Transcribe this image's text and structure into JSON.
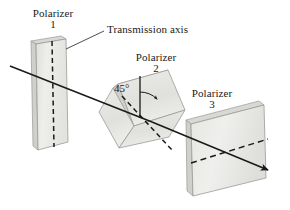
{
  "figure": {
    "background_color": "#ffffff",
    "width": 290,
    "height": 210
  },
  "labels": {
    "polarizer1_name": "Polarizer",
    "polarizer1_number": "1",
    "polarizer2_name": "Polarizer",
    "polarizer2_number": "2",
    "polarizer3_name": "Polarizer",
    "polarizer3_number": "3",
    "transmission_axis": "Transmission axis",
    "angle": "45°"
  },
  "colors": {
    "slab_fill": "#e9e9e6",
    "slab_fill_light": "#f3f3f1",
    "slab_edge": "#9a9a96",
    "slab_side": "#d2d2ce",
    "ray": "#1a1a1a",
    "axis_dash": "#1a1a1a",
    "text": "#1a1a1a",
    "leader": "#3a3a3a"
  },
  "geometry": {
    "slab1": {
      "label": "polarizer-1-slab",
      "face": "36,44 66,39 68,142 38,150",
      "side": "36,44 38,150 33,146 31,41",
      "top": "31,41 61,36 66,39 36,44",
      "axis_dash": "52,41 54,146",
      "orientation": "vertical transmission axis"
    },
    "slab2": {
      "label": "polarizer-2-slab",
      "face": "118,84 168,70 185,110 134,126",
      "side": "118,84 134,126 128,131 113,88",
      "top": "113,88 163,74 168,70 118,84",
      "axis_dash": "125,100 175,152",
      "orientation": "transmission axis at 45 degrees"
    },
    "slab3": {
      "label": "polarizer-3-slab",
      "face": "191,124 264,105 266,178 193,196",
      "side": "191,124 193,196 187,191 186,120",
      "top": "186,120 259,101 264,105 191,124",
      "axis_dash": "190,162 268,139",
      "orientation": "horizontal transmission axis"
    },
    "ray": {
      "label": "light-ray",
      "points": "10,66 152,122 265,168",
      "arrow_tip": "268,170"
    },
    "angle_marker": {
      "vertex": "140,117",
      "vertical_line_top": "140,76",
      "arc_radius": 27,
      "value": "45°"
    },
    "leader_line": {
      "from": "106,31",
      "to": "66,49"
    }
  }
}
